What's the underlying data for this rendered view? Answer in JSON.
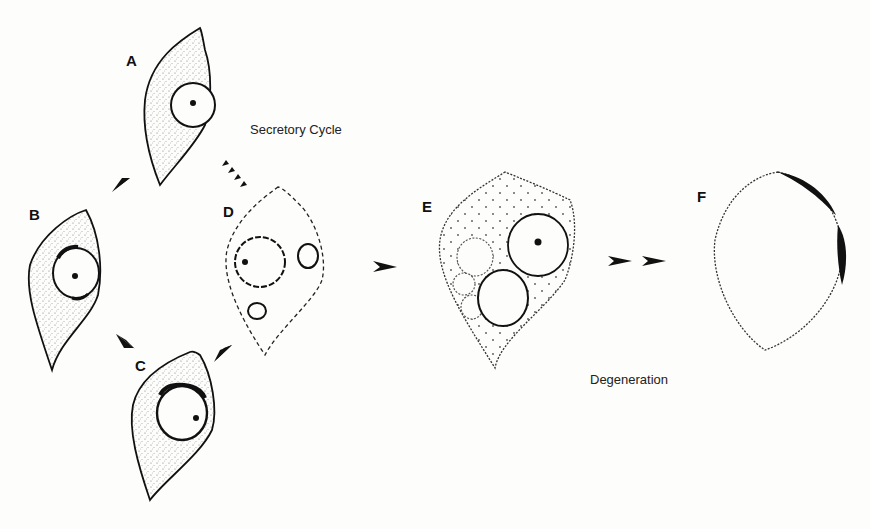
{
  "diagram": {
    "captions": {
      "secretory_cycle": "Secretory Cycle",
      "degeneration": "Degeneration"
    },
    "cells": [
      {
        "id": "A",
        "label": "A",
        "stage": "secretory-cycle",
        "outline": "solid",
        "cytoplasm": "stippled"
      },
      {
        "id": "B",
        "label": "B",
        "stage": "secretory-cycle",
        "outline": "solid",
        "cytoplasm": "stippled"
      },
      {
        "id": "C",
        "label": "C",
        "stage": "secretory-cycle",
        "outline": "solid",
        "cytoplasm": "stippled"
      },
      {
        "id": "D",
        "label": "D",
        "stage": "secretory-cycle",
        "outline": "dashed",
        "cytoplasm": "clear"
      },
      {
        "id": "E",
        "label": "E",
        "stage": "degeneration",
        "outline": "dotted",
        "cytoplasm": "dotted"
      },
      {
        "id": "F",
        "label": "F",
        "stage": "degeneration",
        "outline": "dotted",
        "cytoplasm": "empty"
      }
    ],
    "arrows": [
      {
        "from": "A",
        "to": "B",
        "style": "solid-arrowhead"
      },
      {
        "from": "B",
        "to": "C",
        "style": "solid-arrowhead"
      },
      {
        "from": "C",
        "to": "D",
        "style": "solid-arrowhead"
      },
      {
        "from": "D",
        "to": "A",
        "style": "dashed-arrowhead"
      },
      {
        "from": "D",
        "to": "E",
        "style": "solid-arrowhead"
      },
      {
        "from": "E",
        "to": "F",
        "style": "double-arrowhead"
      }
    ]
  }
}
